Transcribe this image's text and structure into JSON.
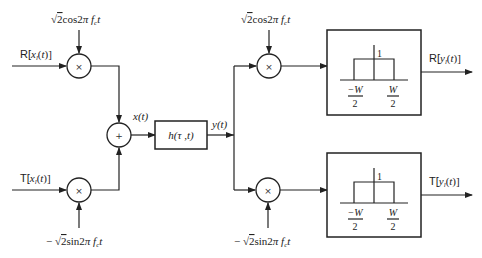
{
  "diagram": {
    "title": "",
    "inputs": {
      "real": "R[x_l(t)]",
      "imag": "T[x_l(t)]"
    },
    "carriers": {
      "tx_cos": "√2cos2πf_c t",
      "tx_sin": "− √2sin2πf_c t",
      "rx_cos": "√2cos2πf_c t",
      "rx_sin": "− √2sin2πf_c t"
    },
    "operators": {
      "multiply": "×",
      "add": "+"
    },
    "signals": {
      "x": "x(t)",
      "y": "y(t)"
    },
    "channel": {
      "label": "h(τ ,t)"
    },
    "filters": [
      {
        "name": "lowpass-filter-real",
        "gain": "1",
        "left_cutoff_num": "−W",
        "left_cutoff_den": "2",
        "right_cutoff_num": "W",
        "right_cutoff_den": "2"
      },
      {
        "name": "lowpass-filter-imag",
        "gain": "1",
        "left_cutoff_num": "−W",
        "left_cutoff_den": "2",
        "right_cutoff_num": "W",
        "right_cutoff_den": "2"
      }
    ],
    "outputs": {
      "real": "R[y_l(t)]",
      "imag": "T[y_l(t)]"
    },
    "colors": {
      "line": "#222222",
      "background": "#ffffff"
    }
  }
}
